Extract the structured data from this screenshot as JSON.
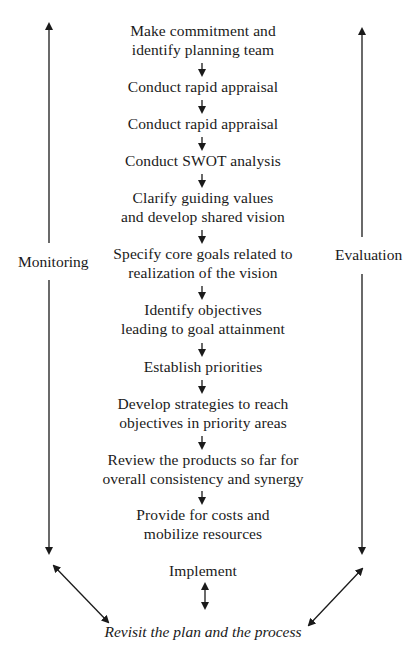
{
  "diagram": {
    "type": "flowchart",
    "orientation": "vertical",
    "steps": [
      {
        "lines": [
          "Make commitment and",
          "identify planning team"
        ]
      },
      {
        "lines": [
          "Conduct rapid appraisal"
        ]
      },
      {
        "lines": [
          "Conduct rapid appraisal"
        ]
      },
      {
        "lines": [
          "Conduct SWOT analysis"
        ]
      },
      {
        "lines": [
          "Clarify guiding values",
          "and develop shared vision"
        ]
      },
      {
        "lines": [
          "Specify core goals related to",
          "realization of the vision"
        ]
      },
      {
        "lines": [
          "Identify objectives",
          "leading to goal attainment"
        ]
      },
      {
        "lines": [
          "Establish priorities"
        ]
      },
      {
        "lines": [
          "Develop strategies to reach",
          "objectives in priority areas"
        ]
      },
      {
        "lines": [
          "Review the products so far for",
          "overall consistency and synergy"
        ]
      },
      {
        "lines": [
          "Provide for costs and",
          "mobilize resources"
        ]
      },
      {
        "lines": [
          "Implement"
        ]
      }
    ],
    "left_track": {
      "label": "Monitoring",
      "arrow": "bidirectional-vertical"
    },
    "right_track": {
      "label": "Evaluation",
      "arrow": "bidirectional-vertical"
    },
    "feedback": {
      "label": "Revisit the plan and the process",
      "style": "italic"
    },
    "connectors": {
      "between_steps": "down-arrow",
      "implement_to_revisit": "double-headed-vertical",
      "monitoring_to_revisit": "double-headed-diagonal",
      "evaluation_to_revisit": "double-headed-diagonal"
    },
    "colors": {
      "ink": "#1a1a1a",
      "background": "#ffffff"
    }
  }
}
